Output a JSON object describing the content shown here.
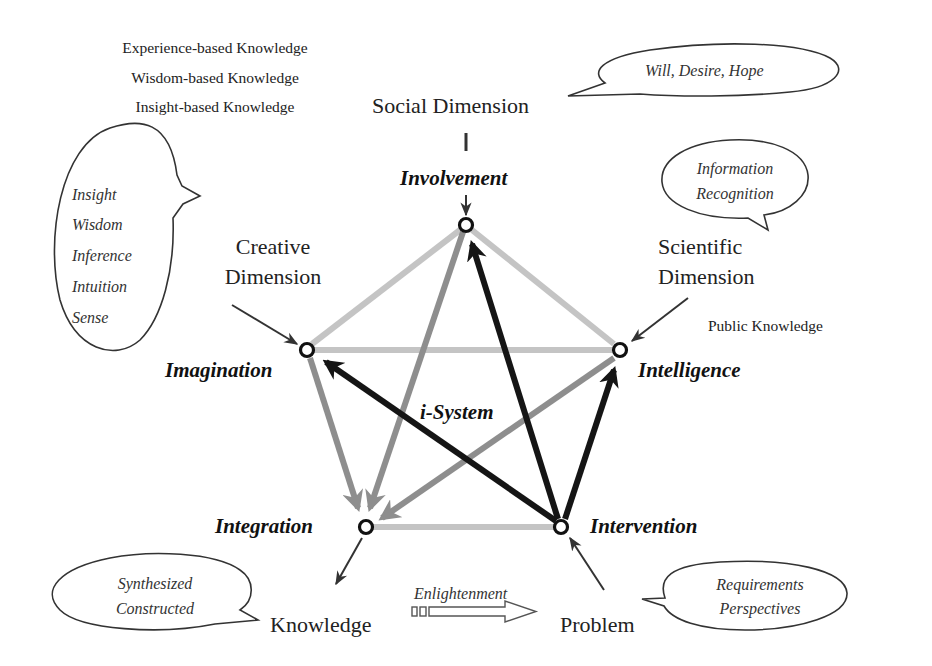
{
  "top_left_knowledge": [
    "Experience-based Knowledge",
    "Wisdom-based Knowledge",
    "Insight-based Knowledge"
  ],
  "dimensions": {
    "social": "Social Dimension",
    "creative": [
      "Creative",
      "Dimension"
    ],
    "scientific": [
      "Scientific",
      "Dimension"
    ]
  },
  "nodes": {
    "involvement": "Involvement",
    "imagination": "Imagination",
    "intelligence": "Intelligence",
    "integration": "Integration",
    "intervention": "Intervention"
  },
  "center_label": "i-System",
  "bubbles": {
    "social": "Will, Desire, Hope",
    "creative": [
      "Insight",
      "Wisdom",
      "Inference",
      "Intuition",
      "Sense"
    ],
    "scientific": [
      "Information",
      "Recognition"
    ],
    "knowledge": [
      "Synthesized",
      "Constructed"
    ],
    "problem": [
      "Requirements",
      "Perspectives"
    ]
  },
  "public_knowledge": "Public Knowledge",
  "bottom": {
    "knowledge": "Knowledge",
    "enlightenment": "Enlightenment",
    "problem": "Problem"
  },
  "colors": {
    "light_edge": "#c4c4c4",
    "mid_edge": "#8e8e8e",
    "dark_edge": "#151515",
    "text": "#222222"
  }
}
